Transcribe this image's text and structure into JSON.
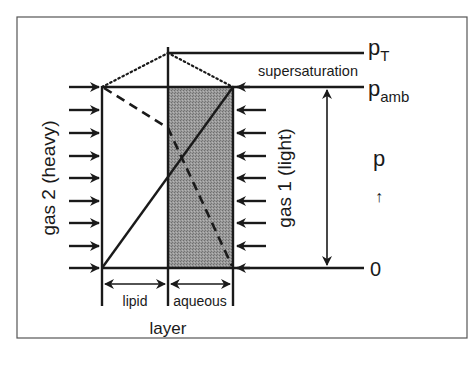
{
  "diagram": {
    "type": "membrane gas diffusion schematic",
    "levels": {
      "p_total": {
        "symbol": "p",
        "subscript": "T"
      },
      "p_ambient": {
        "symbol": "p",
        "subscript": "amb"
      },
      "zero": "0"
    },
    "region_label": "supersaturation",
    "axis_label": "p",
    "axis_arrow": "↑",
    "left_gas_label": "gas 2 (heavy)",
    "right_gas_label": "gas 1 (light)",
    "layers": {
      "lipid": "lipid",
      "aqueous": "aqueous",
      "caption": "layer"
    },
    "colors": {
      "line": "#1a1a1a",
      "shade": "#8c8c8c",
      "frame": "#555555",
      "background": "#ffffff"
    }
  }
}
